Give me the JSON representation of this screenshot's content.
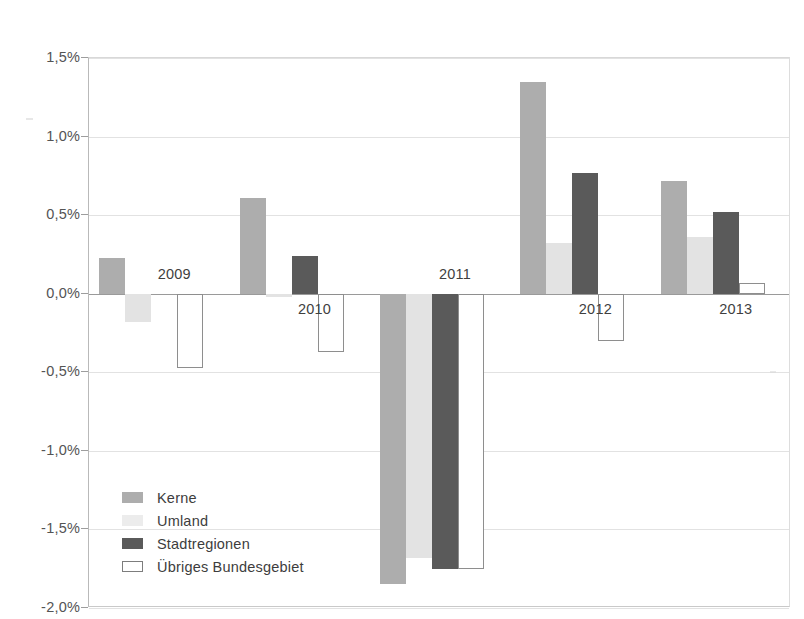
{
  "chart_data": {
    "type": "bar",
    "title": "",
    "subtitle": "",
    "xlabel": "",
    "ylabel": "",
    "categories": [
      "2009",
      "2010",
      "2011",
      "2012",
      "2013"
    ],
    "series": [
      {
        "name": "Kerne",
        "color": "#adadad",
        "values": [
          0.23,
          0.61,
          -1.85,
          1.35,
          0.72
        ]
      },
      {
        "name": "Umland",
        "color": "#e3e3e3",
        "values": [
          -0.18,
          -0.02,
          -1.68,
          0.32,
          0.36
        ]
      },
      {
        "name": "Stadtregionen",
        "color": "#5a5a5a",
        "values": [
          0.0,
          0.24,
          -1.75,
          0.77,
          0.52
        ]
      },
      {
        "name": "Übriges Bundesgebiet",
        "color": "#ffffff",
        "values": [
          -0.47,
          -0.37,
          -1.75,
          -0.3,
          0.07
        ]
      }
    ],
    "ylim": [
      -2.0,
      1.5
    ],
    "ytick_values": [
      1.5,
      1.0,
      0.5,
      0.0,
      -0.5,
      -1.0,
      -1.5,
      -2.0
    ],
    "ytick_labels": [
      "1,5%",
      "1,0%",
      "0,5%",
      "0,0%",
      "-0,5%",
      "-1,0%",
      "-1,5%",
      "-2,0%"
    ],
    "units": "percent",
    "decimal_separator": ",",
    "grid": true,
    "legend_position": "inside-lower-left",
    "orientation": "vertical",
    "group_label_placement": [
      "above",
      "below",
      "above",
      "below",
      "below"
    ]
  },
  "legend": {
    "items": [
      {
        "label": "Kerne",
        "swatch": "kerne"
      },
      {
        "label": "Umland",
        "swatch": "umland"
      },
      {
        "label": "Stadtregionen",
        "swatch": "stadtregionen"
      },
      {
        "label": "Übriges Bundesgebiet",
        "swatch": "uebriges"
      }
    ]
  }
}
